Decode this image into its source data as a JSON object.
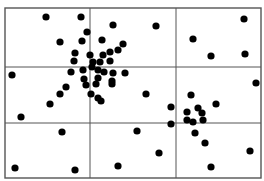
{
  "chart_data": {
    "type": "scatter",
    "title": "",
    "xlabel": "",
    "ylabel": "",
    "grid": {
      "columns": 3,
      "rows": 3
    },
    "frame": {
      "x0": 5,
      "y0": 8,
      "x1": 261,
      "y1": 178
    },
    "grid_lines": {
      "vertical_x": [
        90,
        176
      ],
      "horizontal_y": [
        67,
        123
      ]
    },
    "point_radius": 3.6,
    "colors": {
      "point": "#000000",
      "line": "#555555",
      "background": "#ffffff"
    },
    "points": [
      [
        46,
        17
      ],
      [
        81,
        17
      ],
      [
        156,
        26
      ],
      [
        244,
        19
      ],
      [
        87,
        32
      ],
      [
        113,
        25
      ],
      [
        193,
        39
      ],
      [
        60,
        42
      ],
      [
        82,
        41
      ],
      [
        102,
        40
      ],
      [
        123,
        44
      ],
      [
        118,
        50
      ],
      [
        110,
        52
      ],
      [
        211,
        56
      ],
      [
        245,
        54
      ],
      [
        75,
        53
      ],
      [
        90,
        55
      ],
      [
        103,
        55
      ],
      [
        74,
        61
      ],
      [
        93,
        62
      ],
      [
        100,
        62
      ],
      [
        110,
        61
      ],
      [
        12,
        75
      ],
      [
        71,
        72
      ],
      [
        83,
        70
      ],
      [
        92,
        67
      ],
      [
        98,
        70
      ],
      [
        104,
        72
      ],
      [
        113,
        73
      ],
      [
        125,
        73
      ],
      [
        84,
        79
      ],
      [
        98,
        78
      ],
      [
        112,
        81
      ],
      [
        66,
        87
      ],
      [
        86,
        85
      ],
      [
        96,
        84
      ],
      [
        112,
        84
      ],
      [
        60,
        94
      ],
      [
        91,
        94
      ],
      [
        146,
        94
      ],
      [
        98,
        98
      ],
      [
        101,
        101
      ],
      [
        50,
        104
      ],
      [
        256,
        83
      ],
      [
        191,
        95
      ],
      [
        171,
        107
      ],
      [
        198,
        108
      ],
      [
        216,
        104
      ],
      [
        187,
        112
      ],
      [
        202,
        113
      ],
      [
        187,
        120
      ],
      [
        193,
        122
      ],
      [
        203,
        120
      ],
      [
        21,
        117
      ],
      [
        171,
        124
      ],
      [
        195,
        133
      ],
      [
        205,
        143
      ],
      [
        62,
        132
      ],
      [
        137,
        131
      ],
      [
        159,
        153
      ],
      [
        250,
        151
      ],
      [
        15,
        168
      ],
      [
        75,
        170
      ],
      [
        118,
        166
      ],
      [
        211,
        167
      ]
    ]
  }
}
